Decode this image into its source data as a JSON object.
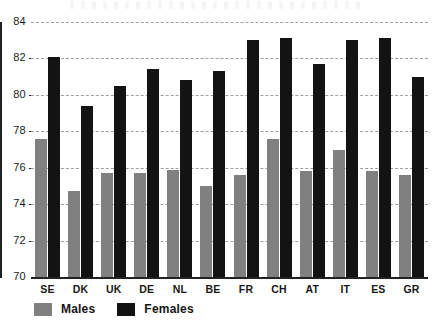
{
  "chart_data": {
    "type": "bar",
    "title": "",
    "xlabel": "",
    "ylabel": "",
    "ylim": [
      70,
      84
    ],
    "ytick_step": 2,
    "yticks": [
      "84",
      "82",
      "80",
      "78",
      "76",
      "74",
      "72",
      "70"
    ],
    "grid": true,
    "legend_position": "bottom-left",
    "categories": [
      "SE",
      "DK",
      "UK",
      "DE",
      "NL",
      "BE",
      "FR",
      "CH",
      "AT",
      "IT",
      "ES",
      "GR"
    ],
    "series": [
      {
        "name": "Males",
        "color": "#808080",
        "values": [
          77.6,
          74.7,
          75.7,
          75.7,
          75.9,
          75.0,
          75.6,
          77.6,
          75.8,
          77.0,
          75.8,
          75.6
        ]
      },
      {
        "name": "Females",
        "color": "#131313",
        "values": [
          82.1,
          79.4,
          80.5,
          81.4,
          80.8,
          81.3,
          83.0,
          83.1,
          81.7,
          83.0,
          83.1,
          81.0
        ]
      }
    ]
  },
  "legend": {
    "items": [
      {
        "label": "Males",
        "swatch": "males"
      },
      {
        "label": "Females",
        "swatch": "females"
      }
    ]
  }
}
